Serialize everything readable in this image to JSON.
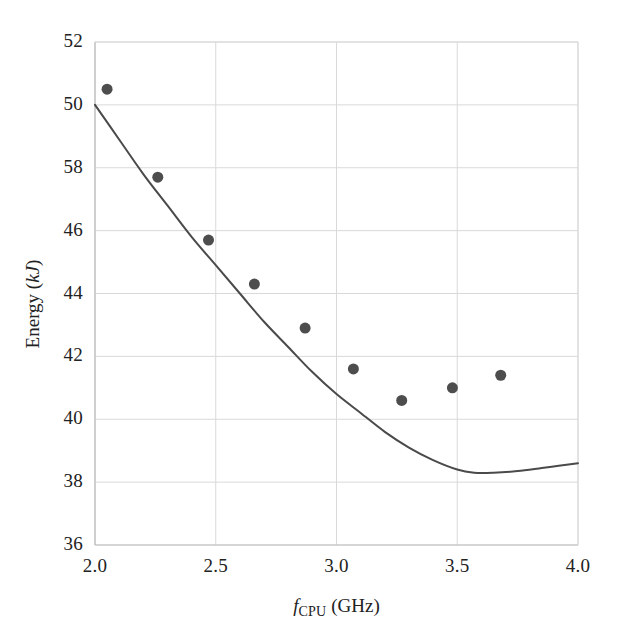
{
  "figure": {
    "background_color": "#ffffff",
    "plot_area": {
      "left": 95,
      "top": 42,
      "right": 578,
      "bottom": 545
    }
  },
  "axes": {
    "x": {
      "label_parts": {
        "symbol": "f",
        "subscript": "CPU",
        "unit": "(GHz)"
      },
      "label_text": "fCPU (GHz)",
      "ticks": [
        "2.0",
        "2.5",
        "3.0",
        "3.5",
        "4.0"
      ],
      "tick_values": [
        2.0,
        2.5,
        3.0,
        3.5,
        4.0
      ],
      "range": [
        2.0,
        4.0
      ]
    },
    "y": {
      "label_parts": {
        "name": "Energy",
        "unit": "kJ"
      },
      "label_text": "Energy (kJ)",
      "ticks": [
        "52",
        "50",
        "58",
        "46",
        "44",
        "42",
        "40",
        "38",
        "36"
      ],
      "tick_values": [
        52,
        50,
        48,
        46,
        44,
        42,
        40,
        38,
        36
      ],
      "range": [
        36,
        52
      ]
    }
  },
  "style": {
    "grid_color": "#d9d9d9",
    "axis_line_color": "#bdbdbd",
    "marker_color": "#4d4d4d",
    "curve_color": "#4a4a4a",
    "marker_radius": 5.5,
    "curve_width": 2.0
  },
  "chart_data": {
    "type": "scatter",
    "title": "",
    "xlabel": "fCPU (GHz)",
    "ylabel": "Energy (kJ)",
    "xlim": [
      2.0,
      4.0
    ],
    "ylim": [
      36,
      52
    ],
    "grid": true,
    "legend": "none",
    "series": [
      {
        "name": "Measured energy",
        "type": "scatter",
        "marker": "circle",
        "color": "#4d4d4d",
        "points": [
          {
            "x": 2.05,
            "y": 50.5
          },
          {
            "x": 2.26,
            "y": 47.7
          },
          {
            "x": 2.47,
            "y": 45.7
          },
          {
            "x": 2.66,
            "y": 44.3
          },
          {
            "x": 2.87,
            "y": 42.9
          },
          {
            "x": 3.07,
            "y": 41.6
          },
          {
            "x": 3.27,
            "y": 40.6
          },
          {
            "x": 3.48,
            "y": 41.0
          },
          {
            "x": 3.68,
            "y": 41.4
          }
        ]
      },
      {
        "name": "Model curve",
        "type": "line",
        "color": "#4a4a4a",
        "points": [
          {
            "x": 2.0,
            "y": 50.0
          },
          {
            "x": 2.1,
            "y": 48.9
          },
          {
            "x": 2.2,
            "y": 47.8
          },
          {
            "x": 2.3,
            "y": 46.8
          },
          {
            "x": 2.4,
            "y": 45.8
          },
          {
            "x": 2.5,
            "y": 44.9
          },
          {
            "x": 2.6,
            "y": 44.0
          },
          {
            "x": 2.7,
            "y": 43.1
          },
          {
            "x": 2.8,
            "y": 42.3
          },
          {
            "x": 2.9,
            "y": 41.5
          },
          {
            "x": 3.0,
            "y": 40.8
          },
          {
            "x": 3.1,
            "y": 40.2
          },
          {
            "x": 3.2,
            "y": 39.6
          },
          {
            "x": 3.3,
            "y": 39.1
          },
          {
            "x": 3.4,
            "y": 38.7
          },
          {
            "x": 3.5,
            "y": 38.4
          },
          {
            "x": 3.57,
            "y": 38.3
          },
          {
            "x": 3.65,
            "y": 38.3
          },
          {
            "x": 3.75,
            "y": 38.35
          },
          {
            "x": 3.85,
            "y": 38.45
          },
          {
            "x": 3.92,
            "y": 38.52
          },
          {
            "x": 4.0,
            "y": 38.6
          }
        ]
      }
    ]
  }
}
